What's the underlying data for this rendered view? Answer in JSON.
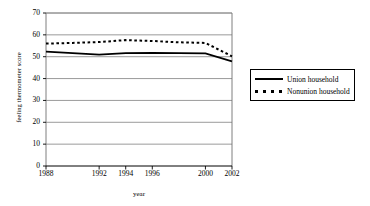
{
  "chart_data": {
    "type": "line",
    "title": "",
    "xlabel": "year",
    "ylabel": "feeling thermometer score",
    "ylim": [
      0,
      70
    ],
    "ytick_labels": [
      "0",
      "10",
      "20",
      "30",
      "40",
      "50",
      "60",
      "70"
    ],
    "ytick_values": [
      0,
      10,
      20,
      30,
      40,
      50,
      60,
      70
    ],
    "xtick_labels": [
      "1988",
      "1992",
      "1994",
      "1996",
      "2000",
      "2002"
    ],
    "xtick_values": [
      1988,
      1992,
      1994,
      1996,
      2000,
      2002
    ],
    "xlim": [
      1988,
      2002
    ],
    "grid": "horizontal",
    "legend_position": "right-outside",
    "x": [
      1988,
      1990,
      1992,
      1994,
      1996,
      1998,
      2000,
      2002
    ],
    "series": [
      {
        "name": "Union household",
        "style": "solid",
        "color": "#000000",
        "values": [
          52.3,
          51.6,
          51.0,
          51.6,
          51.7,
          51.6,
          51.5,
          47.9
        ]
      },
      {
        "name": "Nonunion household",
        "style": "dotted",
        "color": "#000000",
        "values": [
          56.0,
          56.3,
          56.7,
          57.6,
          57.2,
          56.6,
          56.3,
          50.2
        ]
      }
    ]
  },
  "legend": {
    "items": [
      {
        "label": "Union household",
        "style": "solid"
      },
      {
        "label": "Nonunion household",
        "style": "dotted"
      }
    ]
  }
}
